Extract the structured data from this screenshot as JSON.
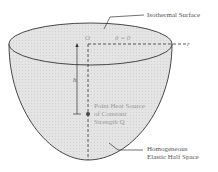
{
  "labels": {
    "isothermal_surface": "Isothermal Surface",
    "origin": "O",
    "theta": "θ = 0",
    "r_axis": "r",
    "h": "h",
    "source_line1": "Point Heat Source",
    "source_line2": "of Constant",
    "source_line3": "Strength Q",
    "halfspace_line1": "Homogeneous",
    "halfspace_line2": "Elastic Half Space"
  },
  "colors": {
    "fill": "#e6e6e6",
    "stroke": "#333333",
    "label_gray": "#9a9a9a"
  }
}
